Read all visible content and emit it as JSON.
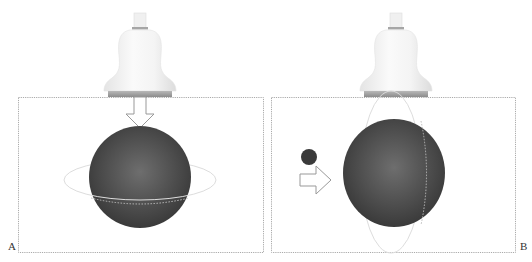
{
  "panels": [
    {
      "id": "A",
      "label": "A",
      "description": "Transducer pressing downward on sphere; equatorial deformation ring",
      "arrow_direction": "down",
      "deformation": "horizontal-ellipse"
    },
    {
      "id": "B",
      "label": "B",
      "description": "Small ball impacting sphere from the left; vertical deformation ring",
      "arrow_direction": "right",
      "deformation": "vertical-ellipse",
      "impactor": "small-ball"
    }
  ],
  "colors": {
    "sphere": "#4a4a4a",
    "sphere_highlight": "#6a6a6a",
    "transducer": "#f2f2f2",
    "transducer_band": "#9a9a9a",
    "frame": "#aaaaaa",
    "ring": "#d8d8d8"
  }
}
